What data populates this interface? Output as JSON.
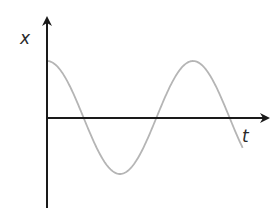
{
  "chart_data": {
    "type": "line",
    "title": "",
    "xlabel": "t",
    "ylabel": "x",
    "function": "x = A cos(2*pi*t/T)",
    "grid": false,
    "legend": null,
    "tick_labels": [],
    "series": [
      {
        "name": "x(t)",
        "color": "#b5b5b5",
        "points_description": "Starts at +A at t=0, crosses zero at T/4, reaches -A at T/2, crosses zero at 3T/4, returns to +A at T, crosses zero at 5T/4, continues downward",
        "normalized_points": [
          {
            "t": 0.0,
            "x": 1.0
          },
          {
            "t": 0.25,
            "x": 0.0
          },
          {
            "t": 0.5,
            "x": -1.0
          },
          {
            "t": 0.75,
            "x": 0.0
          },
          {
            "t": 1.0,
            "x": 1.0
          },
          {
            "t": 1.25,
            "x": 0.0
          },
          {
            "t": 1.34,
            "x": -0.63
          }
        ]
      }
    ]
  },
  "axes": {
    "x_label": "x",
    "t_label": "t",
    "axis_color": "#1a1a1a",
    "curve_color": "#b5b5b5"
  }
}
